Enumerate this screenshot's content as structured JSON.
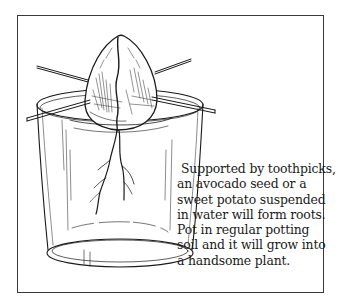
{
  "figure": {
    "illustration": {
      "subject": "avocado-seed-in-glass-icon",
      "elements": [
        "avocado-seed",
        "toothpicks",
        "glass-of-water",
        "roots"
      ]
    },
    "caption": {
      "lines": [
        "Supported by toothpicks,",
        "an avocado seed or a",
        "sweet potato suspended",
        "in water will form roots.",
        "Pot in regular potting",
        "soil and it will grow into",
        "a handsome plant."
      ]
    },
    "colors": {
      "ink": "#1a1a1a",
      "border": "#3a3a3a",
      "background": "#ffffff"
    }
  }
}
